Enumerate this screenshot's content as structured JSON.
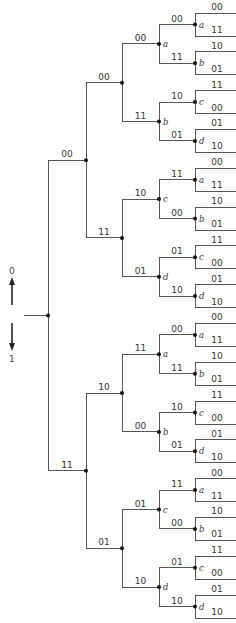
{
  "diagram": {
    "type": "convolutional-code-tree",
    "direction_legend": {
      "up_label": "0",
      "down_label": "1",
      "up_icon": "arrow-up-icon",
      "down_icon": "arrow-down-icon"
    },
    "colors": {
      "line": "#555555",
      "node": "#111111",
      "text": "#333333"
    },
    "root": {
      "edges": [
        "00",
        "11"
      ]
    },
    "level1": [
      {
        "edges": [
          "00",
          "11"
        ]
      },
      {
        "edges": [
          "10",
          "01"
        ]
      }
    ],
    "level2": [
      {
        "edges": [
          "00",
          "11"
        ]
      },
      {
        "edges": [
          "10",
          "01"
        ]
      },
      {
        "edges": [
          "11",
          "00"
        ]
      },
      {
        "edges": [
          "01",
          "10"
        ]
      }
    ],
    "level3": [
      {
        "state": "a",
        "edges": [
          "00",
          "11"
        ]
      },
      {
        "state": "b",
        "edges": [
          "10",
          "01"
        ]
      },
      {
        "state": "c",
        "edges": [
          "11",
          "00"
        ]
      },
      {
        "state": "d",
        "edges": [
          "01",
          "10"
        ]
      },
      {
        "state": "a",
        "edges": [
          "00",
          "11"
        ]
      },
      {
        "state": "b",
        "edges": [
          "10",
          "01"
        ]
      },
      {
        "state": "c",
        "edges": [
          "11",
          "00"
        ]
      },
      {
        "state": "d",
        "edges": [
          "01",
          "10"
        ]
      }
    ],
    "level4": [
      {
        "state": "a",
        "edges": [
          "00",
          "11"
        ]
      },
      {
        "state": "b",
        "edges": [
          "10",
          "01"
        ]
      },
      {
        "state": "c",
        "edges": [
          "11",
          "00"
        ]
      },
      {
        "state": "d",
        "edges": [
          "01",
          "10"
        ]
      },
      {
        "state": "a",
        "edges": [
          "00",
          "11"
        ]
      },
      {
        "state": "b",
        "edges": [
          "10",
          "01"
        ]
      },
      {
        "state": "c",
        "edges": [
          "11",
          "00"
        ]
      },
      {
        "state": "d",
        "edges": [
          "01",
          "10"
        ]
      },
      {
        "state": "a",
        "edges": [
          "00",
          "11"
        ]
      },
      {
        "state": "b",
        "edges": [
          "10",
          "01"
        ]
      },
      {
        "state": "c",
        "edges": [
          "11",
          "00"
        ]
      },
      {
        "state": "d",
        "edges": [
          "01",
          "10"
        ]
      },
      {
        "state": "a",
        "edges": [
          "00",
          "11"
        ]
      },
      {
        "state": "b",
        "edges": [
          "10",
          "01"
        ]
      },
      {
        "state": "c",
        "edges": [
          "11",
          "00"
        ]
      },
      {
        "state": "d",
        "edges": [
          "01",
          "10"
        ]
      }
    ]
  }
}
